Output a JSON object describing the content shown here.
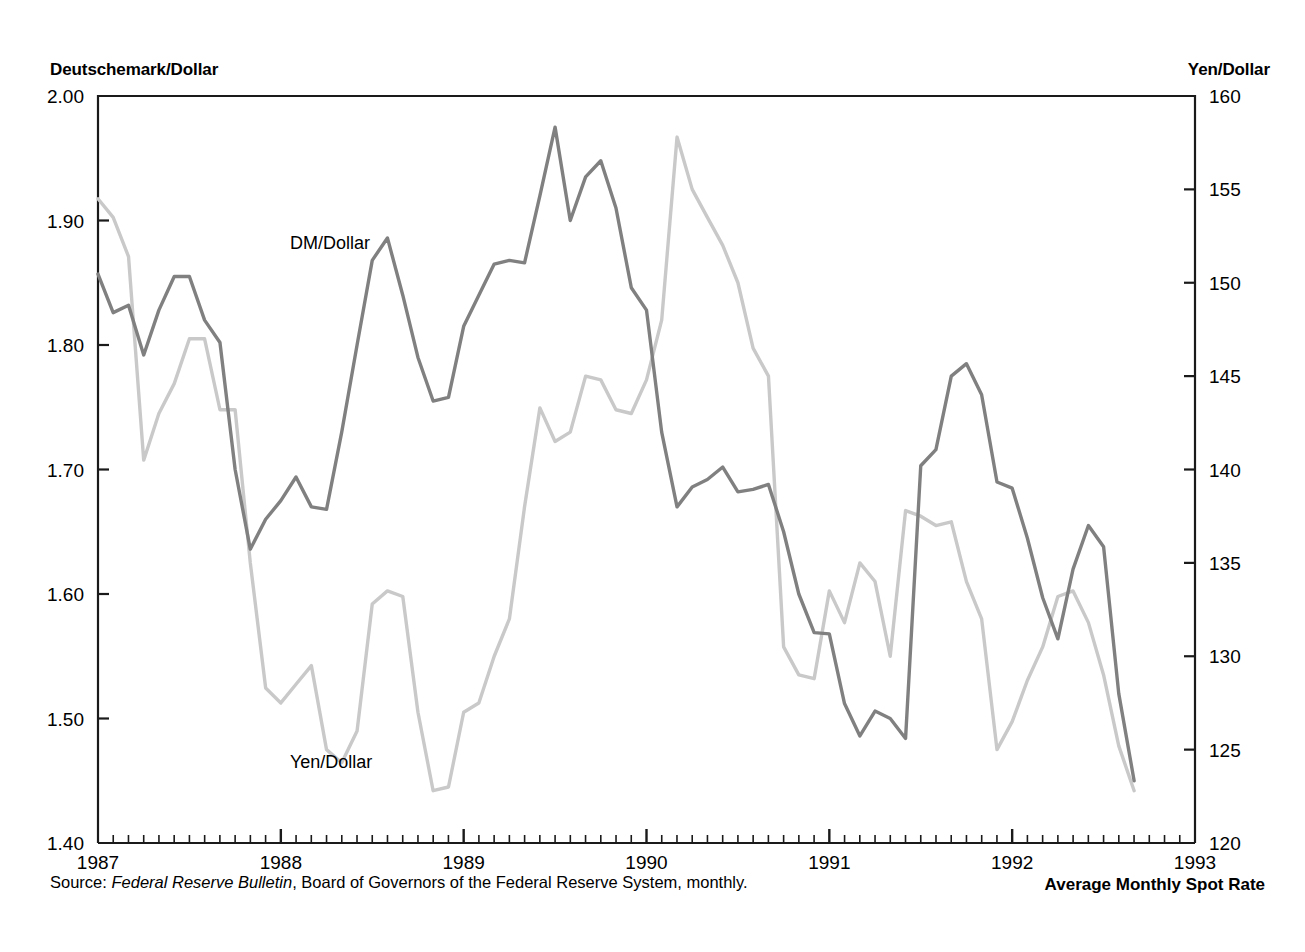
{
  "chart_data": {
    "type": "line",
    "title": "",
    "subtitle": "",
    "bottom_title": "Average Monthly Spot Rate",
    "source_prefix": "Source: ",
    "source_italic": "Federal Reserve Bulletin",
    "source_suffix": ", Board of Governors of the Federal Reserve System, monthly.",
    "xlabel": "",
    "ylabel_left": "Deutschemark/Dollar",
    "ylabel_right": "Yen/Dollar",
    "xlim": [
      1987.0,
      1993.0
    ],
    "x_tick_labels": [
      "1987",
      "1988",
      "1989",
      "1990",
      "1991",
      "1992",
      "1993"
    ],
    "x_ticks": [
      1987,
      1988,
      1989,
      1990,
      1991,
      1992,
      1993
    ],
    "x_minor_tick_interval_months": 1,
    "ylim_left": [
      1.4,
      2.0
    ],
    "y_ticks_left": [
      1.4,
      1.5,
      1.6,
      1.7,
      1.8,
      1.9,
      2.0
    ],
    "y_tick_labels_left": [
      "1.40",
      "1.50",
      "1.60",
      "1.70",
      "1.80",
      "1.90",
      "2.00"
    ],
    "ylim_right": [
      120,
      160
    ],
    "y_ticks_right": [
      120,
      125,
      130,
      135,
      140,
      145,
      150,
      155,
      160
    ],
    "y_tick_labels_right": [
      "120",
      "125",
      "130",
      "135",
      "140",
      "145",
      "150",
      "155",
      "160"
    ],
    "grid": false,
    "legend_position": "inline-annotations",
    "colors": {
      "dm_line": "#808080",
      "yen_line": "#c9c9c9",
      "axis": "#1a1a1a",
      "text": "#000000",
      "background": "#ffffff"
    },
    "series": [
      {
        "name": "DM/Dollar",
        "axis": "left",
        "color": "#808080",
        "annotation": "DM/Dollar",
        "annotation_x": 1988.05,
        "annotation_y": 1.877,
        "x": [
          1987.0,
          1987.083,
          1987.167,
          1987.25,
          1987.333,
          1987.417,
          1987.5,
          1987.583,
          1987.667,
          1987.75,
          1987.833,
          1987.917,
          1988.0,
          1988.083,
          1988.167,
          1988.25,
          1988.333,
          1988.417,
          1988.5,
          1988.583,
          1988.667,
          1988.75,
          1988.833,
          1988.917,
          1989.0,
          1989.083,
          1989.167,
          1989.25,
          1989.333,
          1989.417,
          1989.5,
          1989.583,
          1989.667,
          1989.75,
          1989.833,
          1989.917,
          1990.0,
          1990.083,
          1990.167,
          1990.25,
          1990.333,
          1990.417,
          1990.5,
          1990.583,
          1990.667,
          1990.75,
          1990.833,
          1990.917,
          1991.0,
          1991.083,
          1991.167,
          1991.25,
          1991.333,
          1991.417,
          1991.5,
          1991.583,
          1991.667,
          1991.75,
          1991.833,
          1991.917,
          1992.0,
          1992.083,
          1992.167,
          1992.25,
          1992.333,
          1992.417,
          1992.5,
          1992.583,
          1992.667
        ],
        "values": [
          1.857,
          1.826,
          1.832,
          1.792,
          1.828,
          1.855,
          1.855,
          1.82,
          1.802,
          1.7,
          1.636,
          1.66,
          1.675,
          1.694,
          1.67,
          1.668,
          1.73,
          1.8,
          1.868,
          1.886,
          1.84,
          1.79,
          1.755,
          1.758,
          1.815,
          1.84,
          1.865,
          1.868,
          1.866,
          1.92,
          1.975,
          1.9,
          1.935,
          1.948,
          1.91,
          1.846,
          1.828,
          1.73,
          1.67,
          1.686,
          1.692,
          1.702,
          1.682,
          1.684,
          1.688,
          1.65,
          1.6,
          1.569,
          1.568,
          1.512,
          1.486,
          1.506,
          1.5,
          1.484,
          1.703,
          1.716,
          1.775,
          1.785,
          1.76,
          1.69,
          1.685,
          1.645,
          1.597,
          1.564,
          1.62,
          1.655,
          1.638,
          1.52,
          1.45
        ]
      },
      {
        "name": "Yen/Dollar",
        "axis": "right",
        "color": "#c9c9c9",
        "annotation": "Yen/Dollar",
        "annotation_x": 1988.05,
        "annotation_y": 124.0,
        "x": [
          1987.0,
          1987.083,
          1987.167,
          1987.25,
          1987.333,
          1987.417,
          1987.5,
          1987.583,
          1987.667,
          1987.75,
          1987.833,
          1987.917,
          1988.0,
          1988.083,
          1988.167,
          1988.25,
          1988.333,
          1988.417,
          1988.5,
          1988.583,
          1988.667,
          1988.75,
          1988.833,
          1988.917,
          1989.0,
          1989.083,
          1989.167,
          1989.25,
          1989.333,
          1989.417,
          1989.5,
          1989.583,
          1989.667,
          1989.75,
          1989.833,
          1989.917,
          1990.0,
          1990.083,
          1990.167,
          1990.25,
          1990.333,
          1990.417,
          1990.5,
          1990.583,
          1990.667,
          1990.75,
          1990.833,
          1990.917,
          1991.0,
          1991.083,
          1991.167,
          1991.25,
          1991.333,
          1991.417,
          1991.5,
          1991.583,
          1991.667,
          1991.75,
          1991.833,
          1991.917,
          1992.0,
          1992.083,
          1992.167,
          1992.25,
          1992.333,
          1992.417,
          1992.5,
          1992.583,
          1992.667
        ],
        "values": [
          154.5,
          153.5,
          151.4,
          140.5,
          143.0,
          144.6,
          147.0,
          147.0,
          143.2,
          143.2,
          135.0,
          128.3,
          127.5,
          128.5,
          129.5,
          125.0,
          124.3,
          126.0,
          132.8,
          133.5,
          133.2,
          127.0,
          122.8,
          123.0,
          127.0,
          127.5,
          130.0,
          132.0,
          138.0,
          143.3,
          141.5,
          142.0,
          145.0,
          144.8,
          143.2,
          143.0,
          144.8,
          148.0,
          157.8,
          155.0,
          153.5,
          152.0,
          150.0,
          146.5,
          145.0,
          130.5,
          129.0,
          128.8,
          133.5,
          131.8,
          135.0,
          134.0,
          130.0,
          137.8,
          137.5,
          137.0,
          137.2,
          134.0,
          132.0,
          125.0,
          126.5,
          128.7,
          130.5,
          133.2,
          133.5,
          131.8,
          129.0,
          125.2,
          122.8
        ]
      }
    ]
  },
  "plot_geometry": {
    "left": 98,
    "right": 1195,
    "top": 96,
    "bottom": 843
  }
}
